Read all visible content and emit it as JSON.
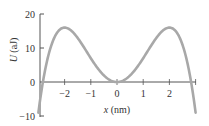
{
  "chart_data": {
    "type": "line",
    "title": "",
    "xlabel": "x (nm)",
    "ylabel": "U (aJ)",
    "xlim": [
      -3,
      3
    ],
    "ylim": [
      -10,
      20
    ],
    "x_ticks": [
      "-2",
      "-1",
      "0",
      "1",
      "2"
    ],
    "y_ticks": [
      "20",
      "10",
      "0",
      "-10"
    ],
    "grid": false,
    "legend": "none",
    "series": [
      {
        "name": "U(x)",
        "color": "#a8a8a8",
        "x": [
          -3.0,
          -2.83,
          -2.5,
          -2.0,
          -1.5,
          -1.0,
          -0.5,
          0.0,
          0.5,
          1.0,
          1.5,
          2.0,
          2.5,
          2.83,
          3.0
        ],
        "values": [
          -9,
          0,
          11,
          16,
          13,
          7,
          2,
          0,
          2,
          7,
          13,
          16,
          11,
          0,
          -9
        ]
      }
    ]
  },
  "axes": {
    "x_label_var": "x",
    "x_label_unit": " (nm)",
    "y_label_var": "U",
    "y_label_unit": " (aJ)",
    "x_tick_labels": [
      "−2",
      "−1",
      "0",
      "1",
      "2"
    ],
    "y_tick_labels": [
      "20",
      "10",
      "0",
      "−10"
    ]
  }
}
